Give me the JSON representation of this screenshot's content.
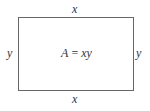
{
  "diagram": {
    "type": "rectangle-area",
    "labels": {
      "top": "x",
      "bottom": "x",
      "left": "y",
      "right": "y"
    },
    "formula": {
      "lhs": "A",
      "equals": "=",
      "rhs": "xy"
    },
    "stroke_color": "#666666"
  }
}
